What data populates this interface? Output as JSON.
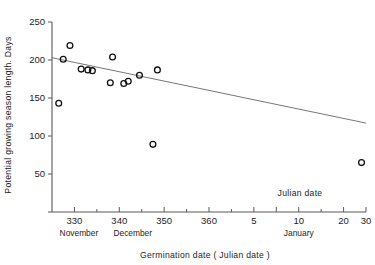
{
  "chart_data": {
    "type": "scatter",
    "title": "",
    "xlabel": "Germination  date  ( Julian date )",
    "ylabel": "Potential  growing  season  length. Days",
    "annotation": "Julian  date",
    "xlim": [
      325,
      395
    ],
    "ylim": [
      0,
      250
    ],
    "grid": false,
    "legend": "none",
    "x_tick_values": [
      330,
      340,
      350,
      360,
      370,
      375,
      380,
      390,
      395
    ],
    "x_tick_labels": [
      "330",
      "340",
      "350",
      "360",
      "5",
      "",
      "10",
      "20",
      "30"
    ],
    "x_minor_ticks": [
      335,
      345,
      355,
      365,
      385
    ],
    "y_tick_values": [
      0,
      50,
      100,
      150,
      200,
      250
    ],
    "y_tick_labels": [
      "",
      "50",
      "100",
      "150",
      "200",
      "250"
    ],
    "month_bands": [
      {
        "label": "November",
        "center": 331
      },
      {
        "label": "December",
        "center": 343
      },
      {
        "label": "January",
        "center": 380
      }
    ],
    "points": [
      {
        "x": 326.5,
        "y": 143
      },
      {
        "x": 327.5,
        "y": 201
      },
      {
        "x": 329.0,
        "y": 219
      },
      {
        "x": 331.5,
        "y": 188
      },
      {
        "x": 333.0,
        "y": 187
      },
      {
        "x": 334.0,
        "y": 186
      },
      {
        "x": 338.0,
        "y": 170
      },
      {
        "x": 338.5,
        "y": 204
      },
      {
        "x": 341.0,
        "y": 169
      },
      {
        "x": 342.0,
        "y": 172
      },
      {
        "x": 344.5,
        "y": 180
      },
      {
        "x": 347.5,
        "y": 89
      },
      {
        "x": 348.5,
        "y": 187
      },
      {
        "x": 394.0,
        "y": 65
      }
    ],
    "fit_line": {
      "x_start": 325,
      "y_start": 203,
      "x_end": 395,
      "y_end": 117
    }
  }
}
